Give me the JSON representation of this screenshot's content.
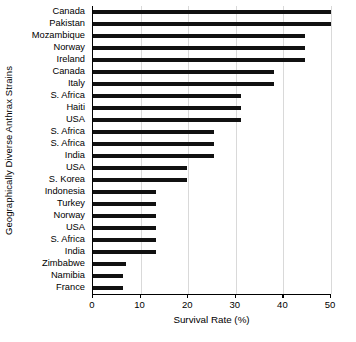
{
  "chart_data": {
    "type": "bar",
    "orientation": "horizontal",
    "title": "",
    "xlabel": "Survival Rate (%)",
    "ylabel": "Geographically Diverse Anthrax Strains",
    "xlim": [
      0,
      50
    ],
    "xticks": [
      0,
      10,
      20,
      30,
      40,
      50
    ],
    "xticklabels": [
      "0",
      "10",
      "20",
      "30",
      "40",
      "50"
    ],
    "grid": "vertical",
    "legend": "none",
    "bar_color": "#111111",
    "categories": [
      "Canada",
      "Pakistan",
      "Mozambique",
      "Norway",
      "Ireland",
      "Canada",
      "Italy",
      "S. Africa",
      "Haiti",
      "USA",
      "S. Africa",
      "S. Africa",
      "India",
      "USA",
      "S. Korea",
      "Indonesia",
      "Turkey",
      "Norway",
      "USA",
      "S. Africa",
      "India",
      "Zimbabwe",
      "Namibia",
      "France"
    ],
    "values": [
      50.0,
      50.5,
      44.5,
      44.5,
      44.5,
      38.0,
      38.0,
      31.0,
      31.0,
      31.0,
      25.5,
      25.5,
      25.5,
      19.8,
      19.8,
      13.2,
      13.2,
      13.2,
      13.2,
      13.2,
      13.2,
      7.0,
      6.2,
      6.2
    ]
  }
}
